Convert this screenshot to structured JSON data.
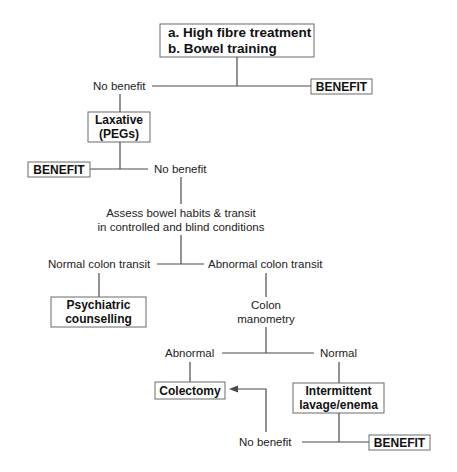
{
  "diagram": {
    "type": "flowchart",
    "nodes": {
      "start": {
        "line1": "a. High fibre treatment",
        "line2": "b. Bowel training"
      },
      "no_benefit_1": "No benefit",
      "benefit_1": "BENEFIT",
      "laxative": {
        "line1": "Laxative",
        "line2": "(PEGs)"
      },
      "benefit_2": "BENEFIT",
      "no_benefit_2": "No benefit",
      "assess": {
        "line1": "Assess bowel habits & transit",
        "line2": "in controlled and blind conditions"
      },
      "normal_transit": "Normal colon transit",
      "abnormal_transit": "Abnormal colon transit",
      "psychiatric": {
        "line1": "Psychiatric",
        "line2": "counselling"
      },
      "manometry": {
        "line1": "Colon",
        "line2": "manometry"
      },
      "abnormal": "Abnormal",
      "normal": "Normal",
      "colectomy": "Colectomy",
      "lavage": {
        "line1": "Intermittent",
        "line2": "lavage/enema"
      },
      "no_benefit_3": "No benefit",
      "benefit_3": "BENEFIT"
    },
    "colors": {
      "line": "#4a4a4a",
      "box_border": "#6a6a6a",
      "text": "#222222"
    }
  }
}
